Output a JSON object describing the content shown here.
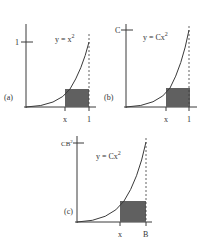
{
  "colors": {
    "line": "#3a3a3a",
    "fill": "#606060",
    "text": "#333333"
  },
  "panels": [
    {
      "id": "a",
      "label": "(a)",
      "equation_base": "y = x",
      "equation_exp": "2",
      "y_tick_label": "1",
      "x_tick_labels": [
        "x",
        "1"
      ]
    },
    {
      "id": "b",
      "label": "(b)",
      "equation_base": "y = Cx",
      "equation_exp": "2",
      "y_tick_label": "C",
      "x_tick_labels": [
        "x",
        "1"
      ]
    },
    {
      "id": "c",
      "label": "(c)",
      "equation_base": "y = Cx",
      "equation_exp": "2",
      "y_tick_label_base": "CB",
      "y_tick_label_exp": "2",
      "x_tick_labels": [
        "x",
        "B"
      ]
    }
  ]
}
